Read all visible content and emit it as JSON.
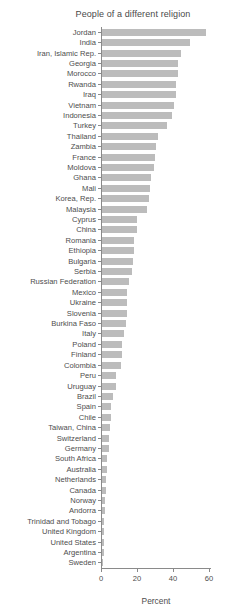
{
  "title": "People of a different religion",
  "chart_data": {
    "type": "bar",
    "orientation": "horizontal",
    "title": "People of a different religion",
    "xlabel": "Percent",
    "xlim": [
      0,
      60
    ],
    "x_ticks": [
      "0",
      "20",
      "40",
      "60"
    ],
    "x_tick_values": [
      0,
      20,
      40,
      60
    ],
    "grid": false,
    "legend": "none",
    "bar_color": "#bcbcbc",
    "axis_color": "#8a8a8a",
    "text_color": "#4d4d4d",
    "categories": [
      "Jordan",
      "India",
      "Iran, Islamic Rep.",
      "Georgia",
      "Morocco",
      "Rwanda",
      "Iraq",
      "Vietnam",
      "Indonesia",
      "Turkey",
      "Thailand",
      "Zambia",
      "France",
      "Moldova",
      "Ghana",
      "Mali",
      "Korea, Rep.",
      "Malaysia",
      "Cyprus",
      "China",
      "Romania",
      "Ethiopia",
      "Bulgaria",
      "Serbia",
      "Russian Federation",
      "Mexico",
      "Ukraine",
      "Slovenia",
      "Burkina Faso",
      "Italy",
      "Poland",
      "Finland",
      "Colombia",
      "Peru",
      "Uruguay",
      "Brazil",
      "Spain",
      "Chile",
      "Taiwan, China",
      "Switzerland",
      "Germany",
      "South Africa",
      "Australia",
      "Netherlands",
      "Canada",
      "Norway",
      "Andorra",
      "Trinidad and Tobago",
      "United Kingdom",
      "United States",
      "Argentina",
      "Sweden"
    ],
    "values": [
      58,
      49,
      44,
      42,
      42,
      41,
      41,
      40,
      39,
      36,
      31,
      30,
      29.5,
      29,
      27,
      26.5,
      26,
      25,
      19.5,
      19.5,
      17.5,
      17.5,
      17,
      16.5,
      15,
      14,
      13.7,
      13.7,
      13.5,
      12,
      11.3,
      11.3,
      10.3,
      8,
      7.5,
      6,
      5.2,
      5,
      4.5,
      4.1,
      3.9,
      3,
      2.5,
      2.3,
      2,
      1.9,
      1.5,
      1.3,
      1.3,
      1.1,
      1,
      0.8
    ]
  }
}
